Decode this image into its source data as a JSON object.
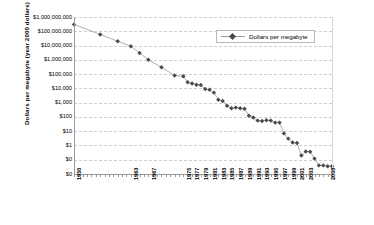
{
  "chart_data": {
    "type": "line",
    "title": "",
    "xlabel": "",
    "ylabel": "Dollars per megabyte (year 2000 dollars)",
    "yscale": "log",
    "ylim": [
      0.01,
      1000000000
    ],
    "xlim": [
      1950,
      2009
    ],
    "grid": true,
    "legend_position": "top-right",
    "ytick_labels": [
      "$1,000,000,000",
      "$100,000,000",
      "$10,000,000",
      "$1,000,000",
      "$100,000",
      "$10,000",
      "$1,000",
      "$100",
      "$10",
      "$1",
      "$0",
      "$0"
    ],
    "ytick_values": [
      1000000000,
      100000000,
      10000000,
      1000000,
      100000,
      10000,
      1000,
      100,
      10,
      1,
      0.1,
      0.01
    ],
    "xtick_labels": [
      "1950",
      "1963",
      "1967",
      "1975",
      "1977",
      "1979",
      "1981",
      "1983",
      "1985",
      "1987",
      "1989",
      "1991",
      "1993",
      "1995",
      "1997",
      "1999",
      "2001",
      "2003",
      "2008"
    ],
    "series": [
      {
        "name": "Dollars per megabyte",
        "color": "#4a4a4a",
        "line_color": "#9b9b9b",
        "marker": "diamond",
        "x": [
          1950,
          1956,
          1960,
          1963,
          1965,
          1967,
          1970,
          1973,
          1975,
          1976,
          1977,
          1978,
          1979,
          1980,
          1981,
          1982,
          1983,
          1984,
          1985,
          1986,
          1987,
          1988,
          1989,
          1990,
          1991,
          1992,
          1993,
          1994,
          1995,
          1996,
          1997,
          1998,
          1999,
          2000,
          2001,
          2002,
          2003,
          2004,
          2005,
          2006,
          2007,
          2008,
          2009
        ],
        "y": [
          300000000,
          60000000,
          20000000,
          9000000,
          3000000,
          1000000,
          300000,
          80000,
          70000,
          27000,
          22000,
          18000,
          17000,
          9000,
          8000,
          5000,
          1600,
          1300,
          600,
          400,
          450,
          400,
          370,
          120,
          90,
          55,
          52,
          58,
          55,
          40,
          40,
          7,
          3,
          1.6,
          1.5,
          0.2,
          0.38,
          0.36,
          0.12,
          0.04,
          0.04,
          0.035,
          0.035
        ]
      }
    ]
  },
  "legend": {
    "entries": [
      {
        "label": "Dollars per megabyte"
      }
    ]
  }
}
